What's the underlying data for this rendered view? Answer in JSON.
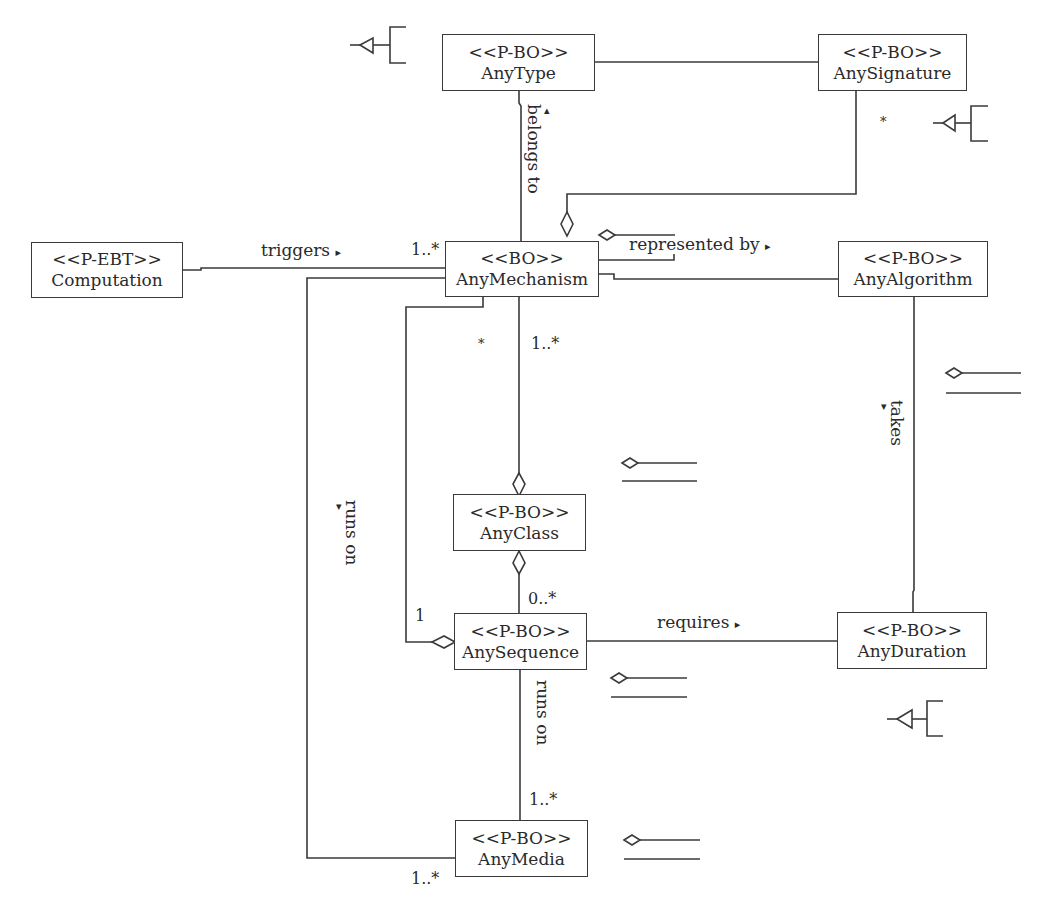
{
  "diagram": {
    "type": "UML class diagram",
    "classes": [
      {
        "id": "anytype",
        "stereotype": "<<P-BO>>",
        "name": "AnyType"
      },
      {
        "id": "anysignature",
        "stereotype": "<<P-BO>>",
        "name": "AnySignature"
      },
      {
        "id": "computation",
        "stereotype": "<<P-EBT>>",
        "name": "Computation"
      },
      {
        "id": "anymechanism",
        "stereotype": "<<BO>>",
        "name": "AnyMechanism"
      },
      {
        "id": "anyalgorithm",
        "stereotype": "<<P-BO>>",
        "name": "AnyAlgorithm"
      },
      {
        "id": "anyclass",
        "stereotype": "<<P-BO>>",
        "name": "AnyClass"
      },
      {
        "id": "anysequence",
        "stereotype": "<<P-BO>>",
        "name": "AnySequence"
      },
      {
        "id": "anyduration",
        "stereotype": "<<P-BO>>",
        "name": "AnyDuration"
      },
      {
        "id": "anymedia",
        "stereotype": "<<P-BO>>",
        "name": "AnyMedia"
      }
    ],
    "associations": [
      {
        "from": "AnyMechanism",
        "to": "AnyType",
        "label": "belongs to",
        "direction": "up"
      },
      {
        "from": "Computation",
        "to": "AnyMechanism",
        "label": "triggers",
        "direction": "right",
        "multiplicity_to": "1..*"
      },
      {
        "from": "AnyMechanism",
        "to": "AnyAlgorithm",
        "label": "represented by",
        "direction": "right"
      },
      {
        "from": "AnyAlgorithm",
        "to": "AnyDuration",
        "label": "takes",
        "direction": "down"
      },
      {
        "from": "AnySequence",
        "to": "AnyDuration",
        "label": "requires",
        "direction": "right"
      },
      {
        "from": "AnySequence",
        "to": "AnyMedia",
        "label": "runs on",
        "multiplicity_to": "1..*"
      },
      {
        "from": "AnyMechanism",
        "to": "AnyMedia",
        "label": "runs on",
        "direction": "down",
        "multiplicity_to": "1..*"
      },
      {
        "from": "AnyType",
        "to": "AnySignature",
        "label": ""
      },
      {
        "from": "AnySignature",
        "to": "AnyMechanism",
        "label": "",
        "multiplicity_from": "*",
        "aggregation": true
      },
      {
        "from": "AnyMechanism",
        "to": "AnyClass",
        "label": "",
        "multiplicity": "1..*",
        "aggregation": true
      },
      {
        "from": "AnyClass",
        "to": "AnySequence",
        "label": "",
        "multiplicity": "0..*",
        "aggregation": true
      },
      {
        "from": "AnyMechanism",
        "to": "AnySequence",
        "label": "",
        "multiplicity_from": "*",
        "multiplicity_to": "1",
        "aggregation": true
      }
    ]
  },
  "labels": {
    "belongs_to": "belongs to",
    "triggers": "triggers",
    "represented_by": "represented by",
    "takes": "takes",
    "requires": "requires",
    "runs_on_left": "runs on",
    "runs_on_center": "runs on"
  },
  "multiplicities": {
    "signature_star": "*",
    "triggers_mech": "1..*",
    "mech_star": "*",
    "mech_class": "1..*",
    "class_seq": "0..*",
    "seq_one": "1",
    "seq_media": "1..*",
    "media_left": "1..*"
  },
  "arrows": {
    "up": "▴",
    "right": "▸",
    "down": "▾"
  },
  "legend_icons": [
    {
      "kind": "generalization-bracket",
      "near": "AnyType"
    },
    {
      "kind": "generalization-bracket",
      "near": "AnySignature"
    },
    {
      "kind": "generalization-bracket",
      "near": "AnyDuration"
    },
    {
      "kind": "aggregation-pair",
      "near": "AnyAlgorithm"
    },
    {
      "kind": "aggregation-pair",
      "near": "AnyClass"
    },
    {
      "kind": "aggregation-pair",
      "near": "AnySequence"
    },
    {
      "kind": "aggregation-pair",
      "near": "AnyMedia"
    }
  ]
}
